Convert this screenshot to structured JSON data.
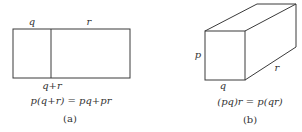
{
  "figure_a": {
    "label_top_left": "q",
    "label_top_right": "r",
    "label_bottom": "q+r",
    "equation": "p(q+r) = pq+pr",
    "caption": "(a)"
  },
  "figure_b": {
    "label_left": "p",
    "label_bottom": "q",
    "label_depth": "r",
    "equation": "(pq)r = p(qr)",
    "caption": "(b)"
  },
  "colors": {
    "stroke": "#3a3a3a",
    "text": "#333333",
    "background": "#ffffff"
  }
}
